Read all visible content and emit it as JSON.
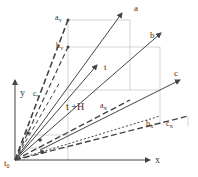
{
  "diagram": {
    "axes": {
      "x_label": "x",
      "y_label": "y",
      "origin_label": "t",
      "origin_sub": "0"
    },
    "labels": {
      "a": "a",
      "b": "b",
      "c": "c",
      "t": "t",
      "tH": "t +H",
      "aY": "a",
      "aY_sub": "Y",
      "bY": "b",
      "bY_sub": "Y",
      "cY": "c",
      "cY_sub": "Y",
      "aX": "a",
      "aX_sub": "X",
      "bX": "b",
      "bX_sub": "X",
      "cX": "c",
      "cX_sub": "X"
    },
    "colors": {
      "line": "#444444",
      "grid": "#bbbbbb"
    }
  }
}
